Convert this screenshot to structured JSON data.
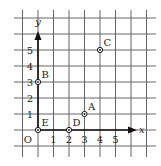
{
  "diagram": {
    "type": "coordinate-grid",
    "origin_label": "O",
    "axes": {
      "x": {
        "label": "x",
        "ticks": [
          "1",
          "2",
          "3",
          "4",
          "5"
        ]
      },
      "y": {
        "label": "y",
        "ticks": [
          "1",
          "2",
          "3",
          "4",
          "5"
        ]
      }
    },
    "points": [
      {
        "name": "A",
        "x": 3,
        "y": 1
      },
      {
        "name": "B",
        "x": 0,
        "y": 3
      },
      {
        "name": "C",
        "x": 4,
        "y": 5
      },
      {
        "name": "D",
        "x": 2,
        "y": 0
      },
      {
        "name": "E",
        "x": 0,
        "y": 0
      }
    ],
    "colors": {
      "grid": "#555555",
      "axis": "#111111",
      "text": "#222222",
      "background": "#ffffff"
    }
  }
}
